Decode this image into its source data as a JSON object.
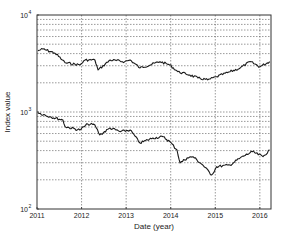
{
  "chart_data": {
    "type": "line",
    "title": "",
    "xlabel": "Date (year)",
    "ylabel": "Index value",
    "yscale": "log",
    "xlim": [
      2011,
      2016.25
    ],
    "ylim": [
      100,
      10000
    ],
    "grid": true,
    "legend": null,
    "x_ticks": [
      2011,
      2012,
      2013,
      2014,
      2015,
      2016
    ],
    "x_tick_labels": [
      "2011",
      "2012",
      "2013",
      "2014",
      "2015",
      "2016"
    ],
    "y_ticks": [
      100,
      1000,
      10000
    ],
    "y_tick_labels": [
      {
        "base": "10",
        "exp": "2"
      },
      {
        "base": "10",
        "exp": "3"
      },
      {
        "base": "10",
        "exp": "4"
      }
    ],
    "series": [
      {
        "name": "upper index",
        "color": "#1a1a1a",
        "x": [
          2011.02,
          2011.13,
          2011.4,
          2011.57,
          2011.63,
          2011.96,
          2012.08,
          2012.3,
          2012.37,
          2012.64,
          2012.97,
          2013.09,
          2013.31,
          2013.76,
          2013.98,
          2014.16,
          2014.43,
          2014.61,
          2014.83,
          2015.03,
          2015.33,
          2015.56,
          2015.78,
          2016.0,
          2016.22
        ],
        "values": [
          4285,
          4460,
          4055,
          3435,
          3220,
          3055,
          3435,
          3435,
          2710,
          3435,
          3305,
          3435,
          2845,
          3305,
          3055,
          2600,
          2405,
          2243,
          2140,
          2313,
          2600,
          2845,
          3305,
          2930,
          3305
        ]
      },
      {
        "name": "lower index",
        "color": "#1a1a1a",
        "x": [
          2011.02,
          2011.29,
          2011.58,
          2011.63,
          2011.96,
          2012.14,
          2012.3,
          2012.41,
          2012.64,
          2012.87,
          2013.09,
          2013.31,
          2013.6,
          2013.83,
          2013.98,
          2014.14,
          2014.21,
          2014.37,
          2014.5,
          2014.72,
          2014.92,
          2015.03,
          2015.33,
          2015.56,
          2015.83,
          2016.07,
          2016.22
        ],
        "values": [
          984,
          895,
          828,
          705,
          652,
          752,
          734,
          580,
          684,
          627,
          652,
          479,
          540,
          556,
          494,
          406,
          298,
          336,
          346,
          284,
          224,
          273,
          284,
          336,
          390,
          346,
          406
        ]
      }
    ]
  },
  "layout": {
    "plot_left": 37,
    "plot_right": 271,
    "plot_top": 15,
    "plot_bottom": 209
  }
}
